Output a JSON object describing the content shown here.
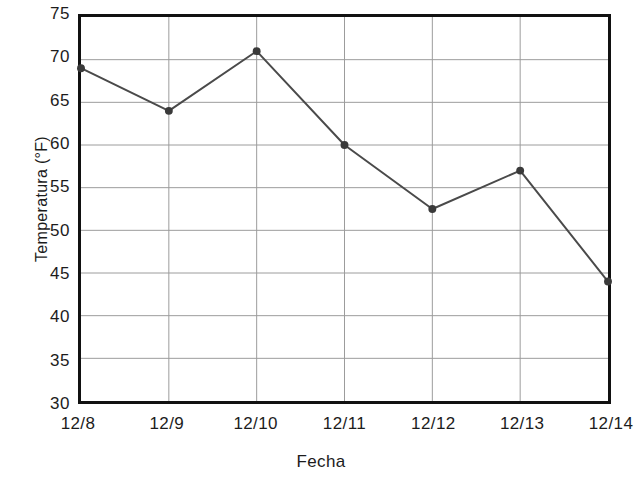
{
  "chart_data": {
    "type": "line",
    "title": "",
    "xlabel": "Fecha",
    "ylabel": "Temperatura (°F)",
    "categories": [
      "12/8",
      "12/9",
      "12/10",
      "12/11",
      "12/12",
      "12/13",
      "12/14"
    ],
    "values": [
      69,
      64,
      71,
      60,
      52.5,
      57,
      44
    ],
    "series": [
      {
        "name": "Temperatura",
        "values": [
          69,
          64,
          71,
          60,
          52.5,
          57,
          44
        ]
      }
    ],
    "ylim": [
      30,
      75
    ],
    "yticks": [
      30,
      35,
      40,
      45,
      50,
      55,
      60,
      65,
      70,
      75
    ],
    "ytick_labels": [
      "30",
      "35",
      "40",
      "45",
      "50",
      "55",
      "60",
      "65",
      "70",
      "75"
    ],
    "xtick_labels": [
      "12/8",
      "12/9",
      "12/10",
      "12/11",
      "12/12",
      "12/13",
      "12/14"
    ],
    "grid": true,
    "legend": "none",
    "marker": "circle",
    "colors": {
      "line": "#4a4a4a",
      "marker": "#3a3a3a",
      "grid": "#9a9a9a",
      "frame": "#111111",
      "text": "#1c1c1c",
      "background": "#ffffff"
    }
  }
}
